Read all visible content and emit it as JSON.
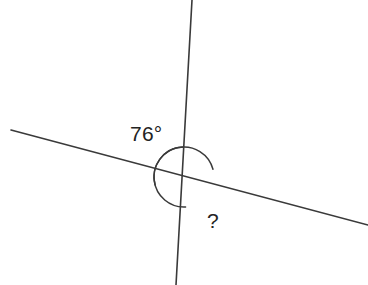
{
  "figure": {
    "background_color": "#ffffff",
    "stroke_color": "#3a3a3a",
    "text_color": "#232323",
    "width": 368,
    "height": 285
  },
  "labels": {
    "known_angle": "76°",
    "unknown_angle": "?"
  },
  "chart_data": {
    "type": "diagram",
    "intersection_point": {
      "x": 184,
      "y": 177
    },
    "lines": [
      {
        "name": "near-vertical-line",
        "x1": 192,
        "y1": 0,
        "x2": 176,
        "y2": 285
      },
      {
        "name": "transversal-line",
        "x1": 11,
        "y1": 130,
        "x2": 368,
        "y2": 225
      }
    ],
    "arcs": [
      {
        "name": "known-angle-arc",
        "label": "76°",
        "value": 76,
        "units": "degrees",
        "radius": 30,
        "start_angle_deg": 93,
        "end_angle_deg": 195,
        "position": "upper-left"
      },
      {
        "name": "unknown-angle-arc",
        "label": "?",
        "value": null,
        "units": "degrees",
        "radius": 30,
        "start_angle_deg": 15,
        "end_angle_deg": 273,
        "position": "lower-right"
      }
    ],
    "annotations": [
      {
        "text": "76°",
        "x": 130,
        "y": 123
      },
      {
        "text": "?",
        "x": 207,
        "y": 210
      }
    ]
  }
}
